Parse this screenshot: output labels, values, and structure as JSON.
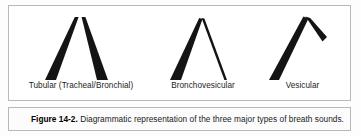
{
  "figure": {
    "border_color": "#b9b9b9",
    "background": "#ffffff",
    "ink_color": "#141414",
    "diagrams": [
      {
        "id": "tubular",
        "label": "Tubular (Tracheal/Bronchial)",
        "description": "Narrow inverted V with two equally thick strokes split at the apex",
        "ascending_stroke": "thick",
        "descending_stroke": "thick"
      },
      {
        "id": "bronchovesicular",
        "label": "Bronchovesicular",
        "description": "Inverted V with thick ascending stroke and thin descending stroke",
        "ascending_stroke": "thick",
        "descending_stroke": "thin"
      },
      {
        "id": "vesicular",
        "label": "Vesicular",
        "description": "Asymmetric peak with long thick ascending stroke and short thick descending stroke",
        "ascending_stroke": "thick",
        "descending_stroke": "short-thick"
      }
    ]
  },
  "caption": {
    "number": "Figure 14-2.",
    "body": " Diagrammatic representation of the three major types of breath sounds."
  }
}
